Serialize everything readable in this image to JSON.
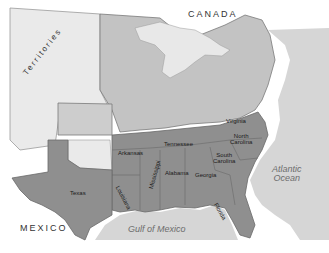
{
  "map": {
    "title": "United States, Confederate and Union States",
    "colors": {
      "water": "#d6d6d6",
      "coast_halo": "#f4f4f4",
      "territories": "#eaeaea",
      "union": "#c3c3c3",
      "border_states": "#cdcdcd",
      "confederacy": "#8f8f8f",
      "border_line": "#7a7a7a",
      "background": "#ffffff"
    },
    "labels": {
      "countries": {
        "canada": "CANADA",
        "mexico": "MEXICO"
      },
      "water_bodies": {
        "atlantic_line1": "Atlantic",
        "atlantic_line2": "Ocean",
        "gulf": "Gulf of Mexico"
      },
      "regions": {
        "territories": "Territories"
      },
      "states": {
        "texas": "Texas",
        "arkansas": "Arkansas",
        "louisiana": "Louisiana",
        "mississippi": "Mississippi",
        "alabama": "Alabama",
        "georgia": "Georgia",
        "florida": "Florida",
        "tennessee": "Tennessee",
        "virginia": "Virginia",
        "north_carolina_line1": "North",
        "north_carolina_line2": "Carolina",
        "south_carolina_line1": "South",
        "south_carolina_line2": "Carolina"
      }
    }
  }
}
